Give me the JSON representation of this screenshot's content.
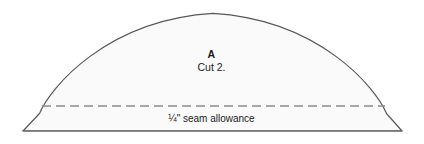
{
  "diagram": {
    "kind": "sewing-pattern-piece",
    "background_color": "#ffffff",
    "piece": {
      "fill_color": "#fafafa",
      "outline_color": "#58585a",
      "outline_width": 1.2,
      "letter": "A",
      "cut_instruction": "Cut 2.",
      "label_color": "#1a1a1a"
    },
    "seam_allowance": {
      "label": "¼\" seam allowance",
      "line_color": "#8c8c8e",
      "line_width": 1.4,
      "dash_pattern": "9 5",
      "y": 106,
      "x_start": 42,
      "x_end": 385
    },
    "geometry": {
      "baseline_y": 131,
      "left_vertex_x": 23,
      "right_vertex_x": 402,
      "apex_x": 213,
      "apex_y": 13,
      "arc_left_x": 41,
      "arc_right_x": 385,
      "arc_base_y": 114
    }
  }
}
